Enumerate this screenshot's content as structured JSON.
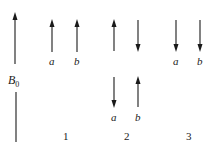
{
  "diagram": {
    "field": {
      "label_main": "B",
      "label_sub": "0",
      "direction": "up"
    },
    "groups": [
      {
        "number": "1",
        "arrows": [
          {
            "label": "a",
            "direction": "up"
          },
          {
            "label": "b",
            "direction": "up"
          }
        ]
      },
      {
        "number": "2",
        "arrows_top": [
          {
            "direction": "up"
          },
          {
            "direction": "down"
          }
        ],
        "arrows_bottom": [
          {
            "label": "a",
            "direction": "down"
          },
          {
            "label": "b",
            "direction": "up"
          }
        ]
      },
      {
        "number": "3",
        "arrows": [
          {
            "label": "a",
            "direction": "down"
          },
          {
            "label": "b",
            "direction": "down"
          }
        ]
      }
    ],
    "colors": {
      "stroke": "#1a1a1a",
      "background": "#ffffff"
    }
  }
}
